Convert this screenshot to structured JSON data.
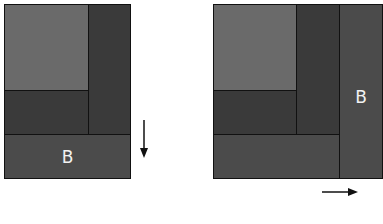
{
  "diagrams": [
    {
      "id": "left",
      "description": "Block B added at bottom (vertical extension)",
      "blocks": [
        {
          "name": "light-block",
          "color": "#6a6a6a"
        },
        {
          "name": "right-dark-strip",
          "color": "#3a3a3a"
        },
        {
          "name": "lower-dark-block",
          "color": "#3a3a3a"
        },
        {
          "name": "block-b",
          "label": "B",
          "color": "#4b4b4b"
        }
      ],
      "arrow": {
        "direction": "down"
      }
    },
    {
      "id": "right",
      "description": "Block B added at right (horizontal extension)",
      "blocks": [
        {
          "name": "light-block",
          "color": "#6a6a6a"
        },
        {
          "name": "middle-dark-strip",
          "color": "#3a3a3a"
        },
        {
          "name": "lower-dark-block",
          "color": "#3a3a3a"
        },
        {
          "name": "bottom-band",
          "color": "#4b4b4b"
        },
        {
          "name": "block-b",
          "label": "B",
          "color": "#4b4b4b"
        }
      ],
      "arrow": {
        "direction": "right"
      }
    }
  ]
}
